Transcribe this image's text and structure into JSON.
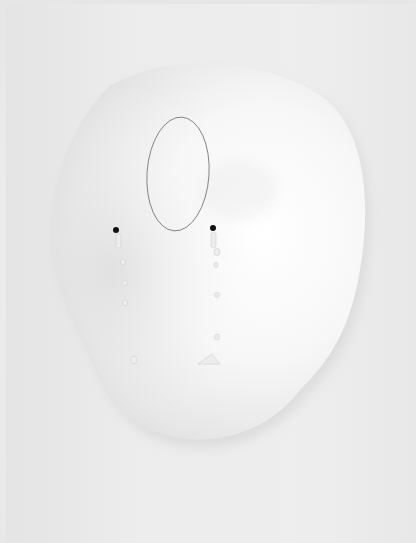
{
  "scene": {
    "description": "Photograph of a white sculptural relief shaped like an irregular rounded head/mask on a pale grey background",
    "background_color": "#e9e9e9",
    "relief_color": "#f7f7f7",
    "shadow_color": "#d9d9d9"
  },
  "elements": {
    "oval_outline": {
      "cx": 178,
      "cy": 174,
      "rx": 31,
      "ry": 57,
      "stroke": "#777777"
    },
    "dots": [
      {
        "name": "left-dot",
        "cx": 116,
        "cy": 230,
        "r": 3,
        "color": "#111111"
      },
      {
        "name": "right-dot",
        "cx": 213,
        "cy": 228,
        "r": 3,
        "color": "#111111"
      }
    ],
    "left_drips": [
      {
        "cx": 119,
        "cy": 248
      },
      {
        "cx": 123,
        "cy": 263
      },
      {
        "cx": 125,
        "cy": 283
      },
      {
        "cx": 125,
        "cy": 303
      },
      {
        "cx": 134,
        "cy": 360
      }
    ],
    "right_drips": [
      {
        "cx": 217,
        "cy": 245
      },
      {
        "cx": 216,
        "cy": 258
      },
      {
        "cx": 217,
        "cy": 278
      },
      {
        "cx": 218,
        "cy": 295
      },
      {
        "cx": 217,
        "cy": 337
      }
    ],
    "right_base_mark": {
      "x": 200,
      "y": 356,
      "w": 20,
      "h": 8
    }
  }
}
